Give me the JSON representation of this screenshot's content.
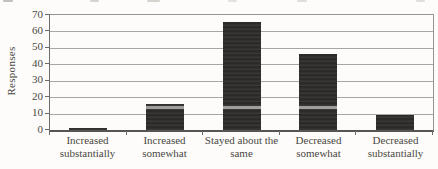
{
  "chart_data": {
    "type": "bar",
    "categories": [
      "Increased\nsubstantially",
      "Increased\nsomewhat",
      "Stayed about the\nsame",
      "Decreased\nsomewhat",
      "Decreased\nsubstantially"
    ],
    "values": [
      1,
      16,
      66,
      46,
      9
    ],
    "title": "",
    "xlabel": "",
    "ylabel": "Responses",
    "ylim": [
      0,
      70
    ],
    "yticks": [
      0,
      10,
      20,
      30,
      40,
      50,
      60,
      70
    ],
    "grid": true,
    "legend": "none",
    "colors": {
      "bar": "#2e2d2b",
      "gridline": "#a8a6a0",
      "axis": "#6e6c66",
      "text": "#4a4843",
      "background": "#fdfcfa"
    }
  }
}
